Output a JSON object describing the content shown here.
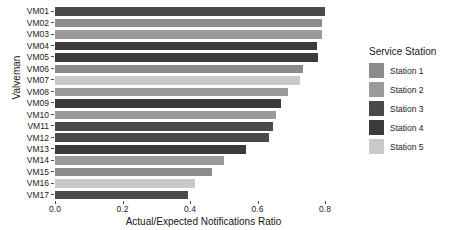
{
  "chart_data": {
    "type": "bar",
    "orientation": "horizontal",
    "title": "",
    "xlabel": "Actual/Expected Notifications Ratio",
    "ylabel": "Valveman",
    "xlim": [
      0.0,
      0.88
    ],
    "xticks": [
      0.0,
      0.2,
      0.4,
      0.6,
      0.8
    ],
    "xtick_labels": [
      "0.0",
      "0.2",
      "0.4",
      "0.6",
      "0.8"
    ],
    "grid": false,
    "legend_position": "right",
    "legend_title": "Service Station",
    "categories": [
      "VM01",
      "VM02",
      "VM03",
      "VM04",
      "VM05",
      "VM06",
      "VM07",
      "VM08",
      "VM09",
      "VM10",
      "VM11",
      "VM12",
      "VM13",
      "VM14",
      "VM15",
      "VM16",
      "VM17"
    ],
    "values": [
      0.8,
      0.79,
      0.79,
      0.775,
      0.78,
      0.735,
      0.725,
      0.69,
      0.67,
      0.655,
      0.645,
      0.635,
      0.565,
      0.5,
      0.465,
      0.415,
      0.395
    ],
    "group_by": "Service Station",
    "groups": [
      "Station 3",
      "Station 1",
      "Station 2",
      "Station 4",
      "Station 4",
      "Station 1",
      "Station 5",
      "Station 2",
      "Station 4",
      "Station 2",
      "Station 3",
      "Station 3",
      "Station 4",
      "Station 2",
      "Station 1",
      "Station 5",
      "Station 3"
    ],
    "series": [
      {
        "name": "Station 1",
        "color": "#8c8c8c"
      },
      {
        "name": "Station 2",
        "color": "#9a9a9a"
      },
      {
        "name": "Station 3",
        "color": "#4a4a4a"
      },
      {
        "name": "Station 4",
        "color": "#3b3b3b"
      },
      {
        "name": "Station 5",
        "color": "#c9c9c9"
      }
    ],
    "bars": [
      {
        "label": "VM01",
        "value": 0.8,
        "group": "Station 3",
        "color": "#4a4a4a"
      },
      {
        "label": "VM02",
        "value": 0.79,
        "group": "Station 1",
        "color": "#8c8c8c"
      },
      {
        "label": "VM03",
        "value": 0.79,
        "group": "Station 2",
        "color": "#9a9a9a"
      },
      {
        "label": "VM04",
        "value": 0.775,
        "group": "Station 4",
        "color": "#3b3b3b"
      },
      {
        "label": "VM05",
        "value": 0.78,
        "group": "Station 4",
        "color": "#3b3b3b"
      },
      {
        "label": "VM06",
        "value": 0.735,
        "group": "Station 1",
        "color": "#8c8c8c"
      },
      {
        "label": "VM07",
        "value": 0.725,
        "group": "Station 5",
        "color": "#c9c9c9"
      },
      {
        "label": "VM08",
        "value": 0.69,
        "group": "Station 2",
        "color": "#9a9a9a"
      },
      {
        "label": "VM09",
        "value": 0.67,
        "group": "Station 4",
        "color": "#3b3b3b"
      },
      {
        "label": "VM10",
        "value": 0.655,
        "group": "Station 2",
        "color": "#9a9a9a"
      },
      {
        "label": "VM11",
        "value": 0.645,
        "group": "Station 3",
        "color": "#4a4a4a"
      },
      {
        "label": "VM12",
        "value": 0.635,
        "group": "Station 3",
        "color": "#4a4a4a"
      },
      {
        "label": "VM13",
        "value": 0.565,
        "group": "Station 4",
        "color": "#3b3b3b"
      },
      {
        "label": "VM14",
        "value": 0.5,
        "group": "Station 2",
        "color": "#9a9a9a"
      },
      {
        "label": "VM15",
        "value": 0.465,
        "group": "Station 1",
        "color": "#8c8c8c"
      },
      {
        "label": "VM16",
        "value": 0.415,
        "group": "Station 5",
        "color": "#c9c9c9"
      },
      {
        "label": "VM17",
        "value": 0.395,
        "group": "Station 3",
        "color": "#4a4a4a"
      }
    ]
  },
  "legend": {
    "title": "Service Station",
    "items": [
      {
        "label": "Station 1",
        "color": "#8c8c8c"
      },
      {
        "label": "Station 2",
        "color": "#9a9a9a"
      },
      {
        "label": "Station 3",
        "color": "#4a4a4a"
      },
      {
        "label": "Station 4",
        "color": "#3b3b3b"
      },
      {
        "label": "Station 5",
        "color": "#c9c9c9"
      }
    ]
  },
  "axes": {
    "x_title": "Actual/Expected Notifications Ratio",
    "y_title": "Valveman"
  }
}
